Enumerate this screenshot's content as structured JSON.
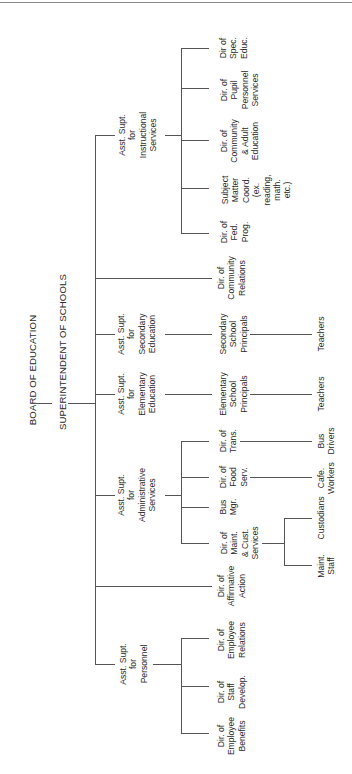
{
  "orientation": "rotated-90-ccw",
  "root": {
    "board": "BOARD OF EDUCATION",
    "superintendent": "SUPERINTENDENT OF SCHOOLS"
  },
  "branches": [
    {
      "lines": [
        "Asst. Supt.",
        "for",
        "Instructional",
        "Services"
      ],
      "children": [
        {
          "lines": [
            "Dir of",
            "Spec.",
            "Educ."
          ]
        },
        {
          "lines": [
            "Dir. of",
            "Pupil",
            "Personnel",
            "Services"
          ]
        },
        {
          "lines": [
            "Dir. of",
            "Community",
            "& Adult",
            "Education"
          ]
        },
        {
          "lines": [
            "Subject",
            "Matter",
            "Coord.",
            "(ex.",
            "reading,",
            "math.",
            "etc.)"
          ]
        },
        {
          "lines": [
            "Dir. of",
            "Fed.",
            "Prog."
          ]
        }
      ]
    },
    {
      "lines": [
        "Dir. of",
        "Community",
        "Relations"
      ]
    },
    {
      "lines": [
        "Asst. Supt.",
        "for",
        "Secondary",
        "Education"
      ],
      "children": [
        {
          "lines": [
            "Secondary",
            "School",
            "Principals"
          ],
          "children": [
            {
              "lines": [
                "Teachers"
              ]
            }
          ]
        }
      ]
    },
    {
      "lines": [
        "Asst. Supt.",
        "for",
        "Elementary",
        "Education"
      ],
      "children": [
        {
          "lines": [
            "Elementary",
            "School",
            "Principals"
          ],
          "children": [
            {
              "lines": [
                "Teachers"
              ]
            }
          ]
        }
      ]
    },
    {
      "lines": [
        "Asst. Supt.",
        "for",
        "Administrative",
        "Services"
      ],
      "children": [
        {
          "lines": [
            "Dir. of",
            "Trans."
          ],
          "children": [
            {
              "lines": [
                "Bus",
                "Drivers"
              ]
            }
          ]
        },
        {
          "lines": [
            "Dir. of",
            "Food",
            "Serv."
          ],
          "children": [
            {
              "lines": [
                "Cafe.",
                "Workers"
              ]
            }
          ]
        },
        {
          "lines": [
            "Bus",
            "Mgr."
          ]
        },
        {
          "lines": [
            "Dir. of",
            "Maint.",
            "& Cust.",
            "Services"
          ],
          "children": [
            {
              "lines": [
                "Custodians"
              ]
            },
            {
              "lines": [
                "Maint.",
                "Staff"
              ]
            }
          ]
        }
      ]
    },
    {
      "lines": [
        "Dir. of",
        "Affirmative",
        "Action"
      ]
    },
    {
      "lines": [
        "Asst. Supt.",
        "for",
        "Personnel"
      ],
      "children": [
        {
          "lines": [
            "Dir. of",
            "Employee",
            "Relations"
          ]
        },
        {
          "lines": [
            "Dir. of",
            "Staff",
            "Develop."
          ]
        },
        {
          "lines": [
            "Dir. of",
            "Employee",
            "Benefits"
          ]
        }
      ]
    }
  ]
}
